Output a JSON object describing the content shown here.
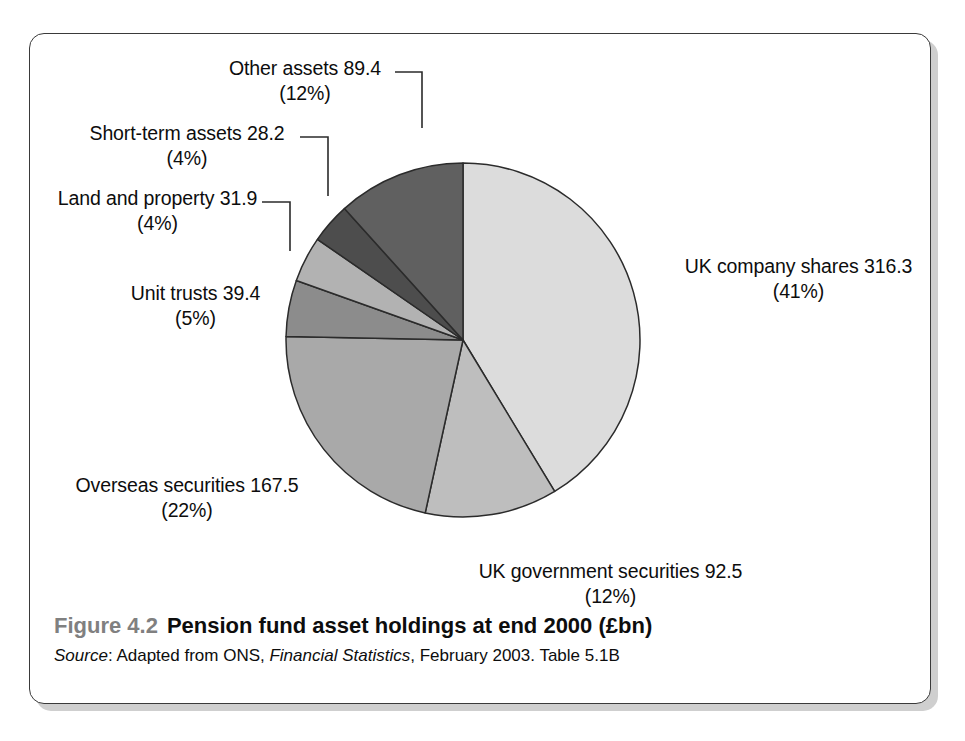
{
  "figure": {
    "number": "Figure 4.2",
    "title": "Pension fund asset holdings at end 2000 (£bn)",
    "source_label": "Source",
    "source_pre": ": Adapted from ONS, ",
    "source_italic": "Financial Statistics",
    "source_post": ", February 2003. Table 5.1B"
  },
  "labels": {
    "uk_company_shares": {
      "name": "UK company shares 316.3",
      "pct": "(41%)"
    },
    "uk_government_securities": {
      "name": "UK government securities 92.5",
      "pct": "(12%)"
    },
    "overseas_securities": {
      "name": "Overseas securities 167.5",
      "pct": "(22%)"
    },
    "unit_trusts": {
      "name": "Unit trusts 39.4",
      "pct": "(5%)"
    },
    "land_and_property": {
      "name": "Land and property 31.9",
      "pct": "(4%)"
    },
    "short_term_assets": {
      "name": "Short-term assets 28.2",
      "pct": "(4%)"
    },
    "other_assets": {
      "name": "Other assets 89.4",
      "pct": "(12%)"
    }
  },
  "chart_data": {
    "type": "pie",
    "title": "Pension fund asset holdings at end 2000 (£bn)",
    "units": "£bn",
    "legend": "none (direct labels with leader lines)",
    "total": 765.2,
    "start_angle_deg": 0,
    "direction": "clockwise",
    "categories": [
      "UK company shares",
      "UK government securities",
      "Overseas securities",
      "Unit trusts",
      "Land and property",
      "Short-term assets",
      "Other assets"
    ],
    "values": [
      316.3,
      92.5,
      167.5,
      39.4,
      31.9,
      28.2,
      89.4
    ],
    "percents": [
      41,
      12,
      22,
      5,
      4,
      4,
      12
    ],
    "colors": [
      "#dcdcdc",
      "#bebebe",
      "#a9a9a9",
      "#8c8c8c",
      "#b2b2b2",
      "#4d4d4d",
      "#606060"
    ],
    "slice_order_clockwise_from_top": [
      "UK company shares",
      "UK government securities",
      "Overseas securities",
      "Unit trusts",
      "Land and property",
      "Short-term assets",
      "Other assets"
    ]
  },
  "style": {
    "frame_border": "#3a3a3a",
    "slice_outline": "#2b2b2b",
    "leader_line": "#2b2b2b",
    "figure_number_color": "#808080",
    "background": "#ffffff"
  }
}
